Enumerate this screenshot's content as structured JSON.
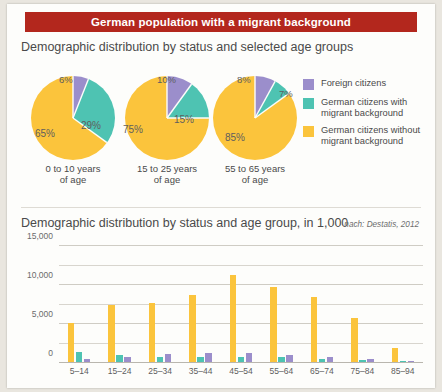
{
  "banner": {
    "title": "German population with a migrant background"
  },
  "section1": {
    "title": "Demographic distribution by status and selected age groups"
  },
  "section2": {
    "title": "Demographic distribution by status and age group, in 1,000",
    "source": "nach: Destatis, 2012"
  },
  "legend": {
    "items": [
      {
        "label": "Foreign citizens",
        "color": "#9b8ecb"
      },
      {
        "label": "German citizens with migrant background",
        "color": "#4ec3b2"
      },
      {
        "label": "German citizens without migrant background",
        "color": "#fbc43c"
      }
    ]
  },
  "colors": {
    "banner": "#b3271d",
    "foreign": "#9b8ecb",
    "german_migrant": "#4ec3b2",
    "german_no_migrant": "#fbc43c",
    "card": "#fdfdfb",
    "page": "#e9e6df"
  },
  "chart_data": [
    {
      "type": "pie",
      "title": "Demographic distribution by status and selected age groups",
      "legend_position": "right",
      "pies": [
        {
          "caption": "0 to 10 years of age",
          "labels": [
            "Foreign citizens",
            "German citizens with migrant background",
            "German citizens without migrant background"
          ],
          "values": [
            6,
            29,
            65
          ],
          "display": [
            "6%",
            "29%",
            "65%"
          ],
          "colors": [
            "#9b8ecb",
            "#4ec3b2",
            "#fbc43c"
          ]
        },
        {
          "caption": "15 to 25 years of age",
          "labels": [
            "Foreign citizens",
            "German citizens with migrant background",
            "German citizens without migrant background"
          ],
          "values": [
            10,
            15,
            75
          ],
          "display": [
            "10%",
            "15%",
            "75%"
          ],
          "colors": [
            "#9b8ecb",
            "#4ec3b2",
            "#fbc43c"
          ]
        },
        {
          "caption": "55 to 65 years of age",
          "labels": [
            "Foreign citizens",
            "German citizens with migrant background",
            "German citizens without migrant background"
          ],
          "values": [
            8,
            7,
            85
          ],
          "display": [
            "8%",
            "7%",
            "85%"
          ],
          "colors": [
            "#9b8ecb",
            "#4ec3b2",
            "#fbc43c"
          ]
        }
      ]
    },
    {
      "type": "bar",
      "title": "Demographic distribution by status and age group, in 1,000",
      "xlabel": "",
      "ylabel": "in 1,000",
      "ylim": [
        0,
        15000
      ],
      "yticks": [
        0,
        5000,
        10000,
        15000
      ],
      "ytick_labels": [
        "0",
        "5,000",
        "10,000",
        "15,000"
      ],
      "gridlines": [
        2500,
        5000,
        7500,
        10000,
        12500,
        15000
      ],
      "grid": true,
      "categories": [
        "5–14",
        "15–24",
        "25–34",
        "35–44",
        "45–54",
        "55–64",
        "65–74",
        "75–84",
        "85–94"
      ],
      "series": [
        {
          "name": "German citizens without migrant background",
          "color": "#fbc43c",
          "values": [
            5000,
            7300,
            7600,
            8600,
            11100,
            9600,
            8300,
            5600,
            1800
          ]
        },
        {
          "name": "German citizens with migrant background",
          "color": "#4ec3b2",
          "values": [
            1300,
            850,
            700,
            700,
            700,
            650,
            450,
            250,
            60
          ]
        },
        {
          "name": "Foreign citizens",
          "color": "#9b8ecb",
          "values": [
            350,
            700,
            1000,
            1150,
            1100,
            900,
            600,
            350,
            40
          ]
        }
      ]
    }
  ]
}
